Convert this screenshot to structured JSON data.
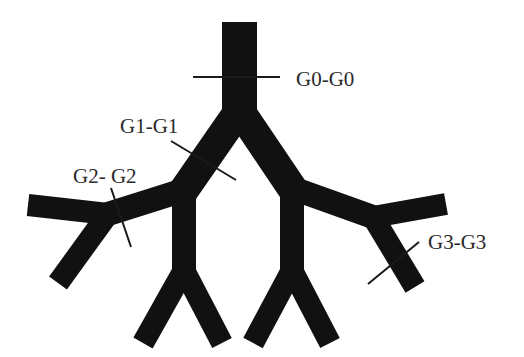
{
  "diagram": {
    "type": "bifurcating-airway-tree",
    "colors": {
      "background": "#ffffff",
      "vessel": "#111111",
      "cut_line": "#1a1a1a",
      "text": "#2a2a2a"
    },
    "labels": [
      {
        "id": "g0",
        "text": "G0-G0",
        "x": 296,
        "y": 69
      },
      {
        "id": "g1",
        "text": "G1-G1",
        "x": 120,
        "y": 116
      },
      {
        "id": "g2",
        "text": "G2- G2",
        "x": 73,
        "y": 166
      },
      {
        "id": "g3",
        "text": "G3-G3",
        "x": 428,
        "y": 232
      }
    ],
    "cut_lines": [
      {
        "id": "g0",
        "x1": 193,
        "y1": 77,
        "x2": 280,
        "y2": 77
      },
      {
        "id": "g1",
        "x1": 171,
        "y1": 141,
        "x2": 236,
        "y2": 180
      },
      {
        "id": "g2",
        "x1": 111,
        "y1": 188,
        "x2": 131,
        "y2": 247
      },
      {
        "id": "g3",
        "x1": 368,
        "y1": 284,
        "x2": 419,
        "y2": 242
      }
    ],
    "segments": [
      {
        "id": "trunk",
        "points": "239.5,22 239.5,112",
        "width": 35,
        "cap": "butt"
      },
      {
        "id": "left-primary",
        "points": "239.5,110 184,190",
        "width": 30,
        "cap": "round"
      },
      {
        "id": "right-primary",
        "points": "239.5,110 292,188",
        "width": 30,
        "cap": "round"
      },
      {
        "id": "left-vertical",
        "points": "184,188 184,272",
        "width": 24,
        "cap": "round"
      },
      {
        "id": "right-vertical",
        "points": "292,186 292,272",
        "width": 24,
        "cap": "round"
      },
      {
        "id": "left-leg-outer",
        "points": "184,270 143,343",
        "width": 22,
        "cap": "butt"
      },
      {
        "id": "left-leg-inner",
        "points": "184,270 222,343",
        "width": 22,
        "cap": "butt"
      },
      {
        "id": "right-leg-inner",
        "points": "292,270 253,343",
        "width": 22,
        "cap": "butt"
      },
      {
        "id": "right-leg-outer",
        "points": "292,270 330,343",
        "width": 22,
        "cap": "butt"
      },
      {
        "id": "left-lateral",
        "points": "184,190 108,214",
        "width": 24,
        "cap": "round"
      },
      {
        "id": "left-arm-upper",
        "points": "108,214 28,205",
        "width": 22,
        "cap": "butt"
      },
      {
        "id": "left-arm-lower",
        "points": "108,214 58,283",
        "width": 22,
        "cap": "butt"
      },
      {
        "id": "right-lateral",
        "points": "292,188 373,217",
        "width": 24,
        "cap": "round"
      },
      {
        "id": "right-arm-upper",
        "points": "373,217 446,204",
        "width": 22,
        "cap": "butt"
      },
      {
        "id": "right-arm-lower",
        "points": "373,217 415,287",
        "width": 22,
        "cap": "butt"
      }
    ]
  }
}
